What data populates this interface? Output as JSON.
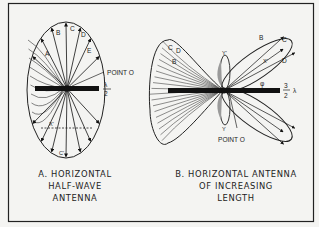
{
  "figure": {
    "panel_a": {
      "arrow_labels": [
        "A",
        "B",
        "C",
        "D",
        "E"
      ],
      "bottom_label": "C'",
      "x_label": "X'",
      "point_label": "POINT O",
      "length_num": "λ",
      "length_den": "2",
      "caption_lines": [
        "A. HORIZONTAL",
        "HALF-WAVE",
        "ANTENNA"
      ]
    },
    "panel_b": {
      "left_labels": [
        "B",
        "C",
        "D"
      ],
      "right_labels": [
        "B",
        "C",
        "D"
      ],
      "x_label": "X'",
      "phi_label": "φ",
      "y_top_label": "Y'",
      "y_bottom_label": "Y",
      "point_label": "POINT O",
      "length_num": "3",
      "length_den": "2",
      "length_unit": "λ",
      "caption_lines": [
        "B. HORIZONTAL ANTENNA",
        "OF INCREASING",
        "LENGTH"
      ]
    }
  }
}
